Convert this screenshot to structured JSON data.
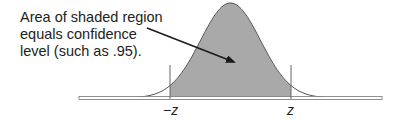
{
  "annotation": {
    "lines": [
      "Area of shaded region",
      "equals confidence",
      "level (such as .95)."
    ]
  },
  "axis_labels": {
    "left": "−z",
    "right": "z"
  },
  "colors": {
    "shade": "#a9a9a9",
    "curve": "#555555",
    "text": "#222222",
    "arrow": "#1a1a1a"
  },
  "chart_data": {
    "type": "area",
    "title": "",
    "distribution": "normal",
    "shaded_interval": [
      "-z",
      "z"
    ],
    "annotation": "Area of shaded region equals confidence level (such as .95).",
    "example_confidence_level": 0.95,
    "x_tick_labels": [
      "−z",
      "z"
    ],
    "xlabel": "",
    "ylabel": "",
    "grid": false
  }
}
